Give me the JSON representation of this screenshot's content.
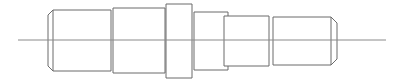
{
  "drawing": {
    "title": "Stepped Shaft / Spool - Side Elevation",
    "view": "side elevation",
    "canvas": {
      "width": 398,
      "height": 82
    },
    "units": "px",
    "line_colors": {
      "outline": "#6b6b6b",
      "centerline": "#8a8a8a",
      "background": "#ffffff"
    },
    "centerline": {
      "label": "axis-centerline",
      "y": 40,
      "x_start": 18,
      "x_end": 386
    },
    "sections": [
      {
        "id": "section-1",
        "label": "Section 1 - left boss",
        "x_left": 48,
        "x_right": 111,
        "y_top": 10,
        "y_bottom": 71,
        "diameter_px": 61,
        "length_px": 63,
        "chamfer_left": 5,
        "chamfer_right": 0
      },
      {
        "id": "section-2",
        "label": "Section 2 - second boss",
        "x_left": 113,
        "x_right": 165,
        "y_top": 8,
        "y_bottom": 73,
        "diameter_px": 65,
        "length_px": 52,
        "chamfer_left": 0,
        "chamfer_right": 0
      },
      {
        "id": "section-3",
        "label": "Section 3 - narrow flange",
        "x_left": 166,
        "x_right": 192,
        "y_top": 4,
        "y_bottom": 78,
        "diameter_px": 74,
        "length_px": 26,
        "chamfer_left": 0,
        "chamfer_right": 0
      },
      {
        "id": "section-4",
        "label": "Section 4 - collar",
        "x_left": 194,
        "x_right": 228,
        "y_top": 12,
        "y_bottom": 70,
        "diameter_px": 58,
        "length_px": 34,
        "chamfer_left": 0,
        "chamfer_right": 0
      },
      {
        "id": "section-5",
        "label": "Section 5 - main body",
        "x_left": 224,
        "x_right": 269,
        "y_top": 16,
        "y_bottom": 66,
        "diameter_px": 50,
        "length_px": 45,
        "chamfer_left": 0,
        "chamfer_right": 0
      },
      {
        "id": "section-6",
        "label": "Section 6 - right boss",
        "x_left": 273,
        "x_right": 337,
        "y_top": 17,
        "y_bottom": 65,
        "diameter_px": 48,
        "length_px": 64,
        "chamfer_left": 0,
        "chamfer_right": 6
      }
    ]
  }
}
